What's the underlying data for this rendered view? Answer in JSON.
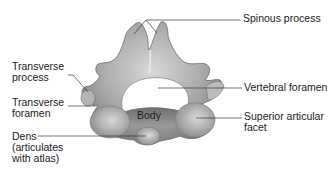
{
  "diagram": {
    "labels": {
      "spinous_process": "Spinous process",
      "vertebral_foramen": "Vertebral foramen",
      "superior_articular_facet_line1": "Superior articular",
      "superior_articular_facet_line2": "facet",
      "transverse_process_line1": "Transverse",
      "transverse_process_line2": "process",
      "transverse_foramen_line1": "Transverse",
      "transverse_foramen_line2": "foramen",
      "dens_line1": "Dens",
      "dens_line2": "(articulates",
      "dens_line3": "with atlas)",
      "body": "Body"
    },
    "colors": {
      "background": "#ffffff",
      "bone_dark": "#7a7a7a",
      "bone_mid": "#a8a8a8",
      "bone_light": "#d4d4d4",
      "leader_line": "#333333",
      "text": "#1a1a1a"
    }
  }
}
